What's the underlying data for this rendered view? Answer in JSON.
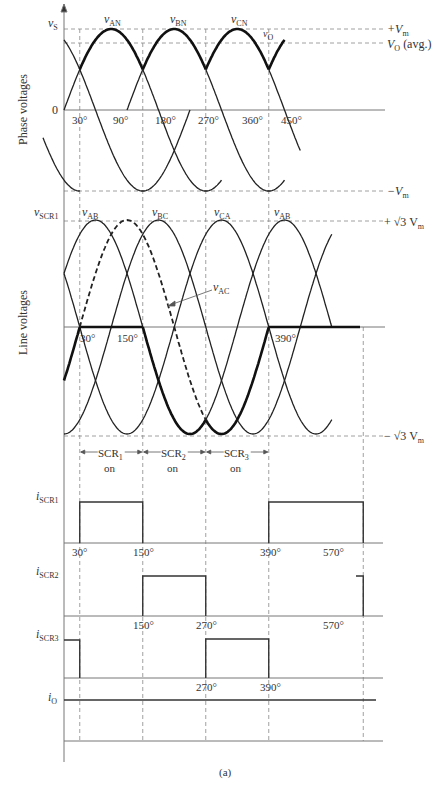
{
  "figure": {
    "caption": "(a)",
    "section_labels": {
      "phase": "Phase voltages",
      "line": "Line voltages"
    }
  },
  "phase_panel": {
    "y_axis_label": "v",
    "y_axis_sub": "S",
    "zero_label": "0",
    "curve_labels": [
      {
        "main": "v",
        "sub": "AN"
      },
      {
        "main": "v",
        "sub": "BN"
      },
      {
        "main": "v",
        "sub": "CN"
      },
      {
        "main": "v",
        "sub": "O"
      }
    ],
    "right_labels": {
      "pos_vm": "+V",
      "pos_vm_sub": "m",
      "vo_avg": "V",
      "vo_avg_sub": "O",
      "vo_avg_tail": " (avg.)",
      "neg_vm": "−V",
      "neg_vm_sub": "m"
    },
    "ticks": [
      "30°",
      "90°",
      "180°",
      "270°",
      "360°",
      "450°"
    ]
  },
  "line_panel": {
    "y_axis_label": "v",
    "y_axis_sub": "SCR1",
    "curve_labels": [
      {
        "main": "v",
        "sub": "AB"
      },
      {
        "main": "v",
        "sub": "BC"
      },
      {
        "main": "v",
        "sub": "CA"
      },
      {
        "main": "v",
        "sub": "AB"
      },
      {
        "main": "v",
        "sub": "AC"
      }
    ],
    "right_labels": {
      "pos": "+ √3 V",
      "pos_sub": "m",
      "neg": "− √3 V",
      "neg_sub": "m"
    },
    "ticks": [
      "30°",
      "150°",
      "390°"
    ]
  },
  "conduction": [
    {
      "main": "SCR",
      "sub": "1",
      "state": "on"
    },
    {
      "main": "SCR",
      "sub": "2",
      "state": "on"
    },
    {
      "main": "SCR",
      "sub": "3",
      "state": "on"
    }
  ],
  "current_panels": [
    {
      "label": "i",
      "sub": "SCR1",
      "ticks": [
        "30°",
        "150°",
        "390°",
        "570°"
      ]
    },
    {
      "label": "i",
      "sub": "SCR2",
      "ticks": [
        "150°",
        "270°",
        "570°"
      ]
    },
    {
      "label": "i",
      "sub": "SCR3",
      "ticks": [
        "270°",
        "390°"
      ]
    },
    {
      "label": "i",
      "sub": "O",
      "ticks": []
    }
  ]
}
